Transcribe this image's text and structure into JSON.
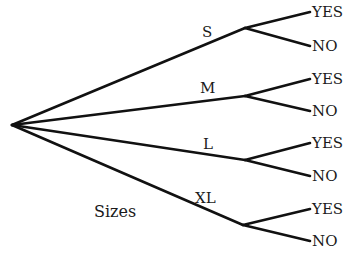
{
  "diagram": {
    "type": "tree",
    "root": {
      "x": 12,
      "y": 125
    },
    "caption": "Sizes",
    "branches": [
      {
        "label": "S",
        "node": {
          "x": 245,
          "y": 28
        },
        "label_pos": {
          "x": 202,
          "y": 37
        },
        "leaves": [
          {
            "label": "YES",
            "x": 310,
            "y": 12
          },
          {
            "label": "NO",
            "x": 310,
            "y": 46
          }
        ]
      },
      {
        "label": "M",
        "node": {
          "x": 245,
          "y": 96
        },
        "label_pos": {
          "x": 200,
          "y": 93
        },
        "leaves": [
          {
            "label": "YES",
            "x": 310,
            "y": 79
          },
          {
            "label": "NO",
            "x": 310,
            "y": 111
          }
        ]
      },
      {
        "label": "L",
        "node": {
          "x": 245,
          "y": 160
        },
        "label_pos": {
          "x": 203,
          "y": 149
        },
        "leaves": [
          {
            "label": "YES",
            "x": 310,
            "y": 143
          },
          {
            "label": "NO",
            "x": 310,
            "y": 176
          }
        ]
      },
      {
        "label": "XL",
        "node": {
          "x": 243,
          "y": 225
        },
        "label_pos": {
          "x": 195,
          "y": 203
        },
        "leaves": [
          {
            "label": "YES",
            "x": 310,
            "y": 209
          },
          {
            "label": "NO",
            "x": 310,
            "y": 241
          }
        ]
      }
    ]
  }
}
